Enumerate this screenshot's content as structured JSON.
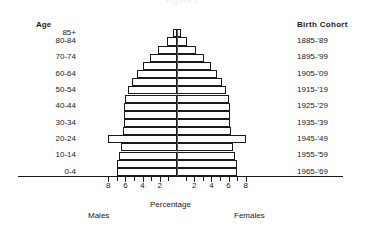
{
  "title": "Figure 1",
  "headers": {
    "age": "Age",
    "cohort": "Birth Cohort"
  },
  "axis": {
    "x_title": "Percentage",
    "left_side": "Males",
    "right_side": "Females",
    "tick_labels_left": [
      "8",
      "6",
      "4",
      "2"
    ],
    "tick_labels_right": [
      "2",
      "4",
      "6",
      "8"
    ]
  },
  "chart_data": {
    "type": "bar",
    "subtype": "population-pyramid",
    "title": "Figure 1",
    "xlabel": "Percentage",
    "ylabel": "Age",
    "xlim": [
      -9,
      9
    ],
    "grid": false,
    "legend": null,
    "categories": [
      "0-4",
      "5-9",
      "10-14",
      "15-19",
      "20-24",
      "25-29",
      "30-34",
      "35-39",
      "40-44",
      "45-49",
      "50-54",
      "55-59",
      "60-64",
      "65-69",
      "70-74",
      "75-79",
      "80-84",
      "85+"
    ],
    "age_tick_labels": [
      "85+",
      "80-84",
      "70-74",
      "60-64",
      "50-54",
      "40-44",
      "30-34",
      "20-24",
      "10-14",
      "0-4"
    ],
    "birth_cohort_labels": [
      "1885-'89",
      "1895-'99",
      "1905-'09",
      "1915-'19",
      "1925-'29",
      "1935-'39",
      "1945-'49",
      "1955-'59",
      "1965-'69"
    ],
    "series": [
      {
        "name": "Males",
        "side": "left",
        "values": [
          7.0,
          7.0,
          6.8,
          6.5,
          8.0,
          6.3,
          6.2,
          6.2,
          6.2,
          6.0,
          5.7,
          5.2,
          4.7,
          4.0,
          3.1,
          2.2,
          1.2,
          0.5
        ]
      },
      {
        "name": "Females",
        "side": "right",
        "values": [
          7.0,
          7.0,
          6.8,
          6.5,
          8.0,
          6.3,
          6.2,
          6.2,
          6.2,
          6.0,
          5.7,
          5.2,
          4.7,
          4.0,
          3.1,
          2.2,
          1.2,
          0.5
        ]
      }
    ]
  }
}
